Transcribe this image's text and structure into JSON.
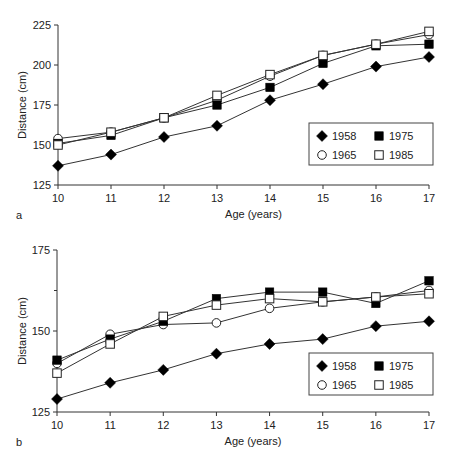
{
  "chart_data": [
    {
      "panel": "a",
      "type": "line",
      "title": "",
      "xlabel": "Age (years)",
      "ylabel": "Distance (cm)",
      "x": [
        10,
        11,
        12,
        13,
        14,
        15,
        16,
        17
      ],
      "xticks": [
        "10",
        "11",
        "12",
        "13",
        "14",
        "15",
        "16",
        "17"
      ],
      "yticks": [
        125,
        150,
        175,
        200,
        225
      ],
      "ylim": [
        125,
        225
      ],
      "xlim": [
        10,
        17
      ],
      "grid": false,
      "legend_position": "lower right",
      "series": [
        {
          "name": "1958",
          "marker": "filled-diamond",
          "values": [
            137,
            144,
            155,
            162,
            178,
            188,
            199,
            205
          ]
        },
        {
          "name": "1965",
          "marker": "open-circle",
          "values": [
            154,
            158,
            167,
            178,
            193,
            206,
            213,
            219
          ]
        },
        {
          "name": "1975",
          "marker": "filled-square",
          "values": [
            151,
            156,
            167,
            175,
            186,
            201,
            212,
            213
          ]
        },
        {
          "name": "1985",
          "marker": "open-square",
          "values": [
            150,
            158,
            167,
            181,
            194,
            206,
            213,
            221
          ]
        }
      ]
    },
    {
      "panel": "b",
      "type": "line",
      "title": "",
      "xlabel": "Age (years)",
      "ylabel": "Distance (cm)",
      "x": [
        10,
        11,
        12,
        13,
        14,
        15,
        16,
        17
      ],
      "xticks": [
        "10",
        "11",
        "12",
        "13",
        "14",
        "15",
        "16",
        "17"
      ],
      "yticks": [
        125,
        150,
        175
      ],
      "yminor": [
        137.5,
        162.5
      ],
      "ylim": [
        125,
        175
      ],
      "xlim": [
        10,
        17
      ],
      "grid": false,
      "legend_position": "lower right",
      "series": [
        {
          "name": "1958",
          "marker": "filled-diamond",
          "values": [
            129,
            134,
            138,
            143,
            146,
            147.5,
            151.5,
            153
          ]
        },
        {
          "name": "1965",
          "marker": "open-circle",
          "values": [
            140,
            149,
            152,
            152.5,
            157,
            159,
            160.5,
            162.5
          ]
        },
        {
          "name": "1975",
          "marker": "filled-square",
          "values": [
            141,
            147.5,
            153,
            160,
            162,
            162,
            158.5,
            165.5
          ]
        },
        {
          "name": "1985",
          "marker": "open-square",
          "values": [
            137,
            146,
            154.5,
            158,
            160,
            159,
            160.5,
            161.5
          ]
        }
      ]
    }
  ],
  "panels": {
    "a": {
      "letter": "a",
      "xlabel": "Age (years)",
      "ylabel": "Distance (cm)"
    },
    "b": {
      "letter": "b",
      "xlabel": "Age (years)",
      "ylabel": "Distance (cm)"
    }
  },
  "legend": [
    {
      "label": "1958",
      "marker": "filled-diamond"
    },
    {
      "label": "1975",
      "marker": "filled-square"
    },
    {
      "label": "1965",
      "marker": "open-circle"
    },
    {
      "label": "1985",
      "marker": "open-square"
    }
  ],
  "colors": {
    "line": "#333333",
    "marker_fill": "#000000",
    "marker_open": "#ffffff",
    "axis": "#333333"
  }
}
